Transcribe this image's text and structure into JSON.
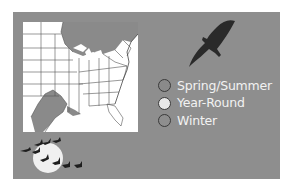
{
  "colors": {
    "panel_background": "#8e8e8e",
    "map_background": "#ffffff",
    "range_shade": "#8a8a8a",
    "legend_text": "#f2f2f2"
  },
  "map": {
    "region": "Eastern United States",
    "shaded_regions": [
      "Great Lakes / northern border",
      "New England / Maine",
      "Texas Gulf coast"
    ]
  },
  "legend": {
    "items": [
      {
        "label": "Spring/Summer",
        "color": "#8a8a8a"
      },
      {
        "label": "Year-Round",
        "color": "#e8e8e8"
      },
      {
        "label": "Winter",
        "color": "#8e8e8e"
      }
    ]
  },
  "icons": {
    "soaring_bird": "bird-silhouette-icon",
    "moon_geese": "moon-with-flock-icon"
  }
}
